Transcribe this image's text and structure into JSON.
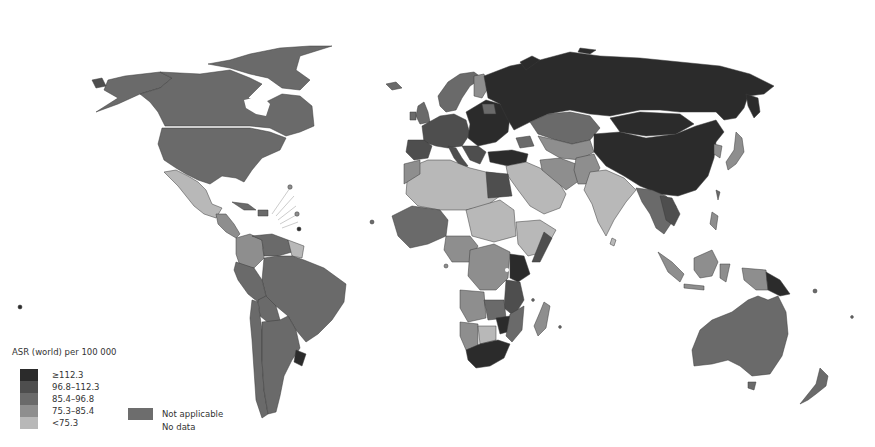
{
  "map": {
    "title": "ASR (world) per 100 000",
    "projection": "world-robinson-like",
    "palette": {
      "c5": "#2b2b2b",
      "c4": "#4e4e4e",
      "c3": "#6a6a6a",
      "c2": "#8e8e8e",
      "c1": "#b8b8b8",
      "not_applicable": "#6d6d6d",
      "no_data": "#ffffff"
    },
    "legend": {
      "title": "ASR (world) per 100 000",
      "classes": [
        {
          "label": "≥112.3",
          "color": "#2b2b2b"
        },
        {
          "label": "96.8–112.3",
          "color": "#4e4e4e"
        },
        {
          "label": "85.4–96.8",
          "color": "#6a6a6a"
        },
        {
          "label": "75.3–85.4",
          "color": "#8e8e8e"
        },
        {
          "label": "<75.3",
          "color": "#b8b8b8"
        }
      ],
      "not_applicable": {
        "label": "Not applicable",
        "color": "#6d6d6d"
      },
      "no_data": {
        "label": "No data",
        "color": "#ffffff"
      }
    },
    "regions": [
      {
        "name": "Canada",
        "class": "c3"
      },
      {
        "name": "United States",
        "class": "c3"
      },
      {
        "name": "Alaska",
        "class": "c3"
      },
      {
        "name": "Greenland",
        "class": "no_data"
      },
      {
        "name": "Mexico",
        "class": "c1"
      },
      {
        "name": "Central America",
        "class": "c2"
      },
      {
        "name": "Caribbean",
        "class": "c3"
      },
      {
        "name": "Colombia",
        "class": "c2"
      },
      {
        "name": "Venezuela",
        "class": "c3"
      },
      {
        "name": "Brazil",
        "class": "c3"
      },
      {
        "name": "Peru",
        "class": "c3"
      },
      {
        "name": "Bolivia",
        "class": "c3"
      },
      {
        "name": "Argentina",
        "class": "c3"
      },
      {
        "name": "Chile",
        "class": "c3"
      },
      {
        "name": "Uruguay",
        "class": "c5"
      },
      {
        "name": "Russia",
        "class": "c5"
      },
      {
        "name": "China",
        "class": "c5"
      },
      {
        "name": "Mongolia",
        "class": "c5"
      },
      {
        "name": "Kazakhstan",
        "class": "c3"
      },
      {
        "name": "Central Asia",
        "class": "c2"
      },
      {
        "name": "Turkey",
        "class": "c5"
      },
      {
        "name": "Western Europe",
        "class": "c4"
      },
      {
        "name": "Eastern Europe",
        "class": "c5"
      },
      {
        "name": "Scandinavia",
        "class": "c3"
      },
      {
        "name": "Finland",
        "class": "c2"
      },
      {
        "name": "UK",
        "class": "c3"
      },
      {
        "name": "Iceland",
        "class": "c3"
      },
      {
        "name": "Middle East",
        "class": "c1"
      },
      {
        "name": "Iran",
        "class": "c2"
      },
      {
        "name": "India",
        "class": "c1"
      },
      {
        "name": "Southeast Asia",
        "class": "c3"
      },
      {
        "name": "Japan",
        "class": "c2"
      },
      {
        "name": "Korea",
        "class": "c2"
      },
      {
        "name": "Indonesia",
        "class": "c2"
      },
      {
        "name": "Papua New Guinea",
        "class": "c5"
      },
      {
        "name": "Australia",
        "class": "c3"
      },
      {
        "name": "New Zealand",
        "class": "c3"
      },
      {
        "name": "North Africa",
        "class": "c1"
      },
      {
        "name": "Egypt",
        "class": "c4"
      },
      {
        "name": "West Africa",
        "class": "c3"
      },
      {
        "name": "Central Africa",
        "class": "c2"
      },
      {
        "name": "East Africa",
        "class": "c4"
      },
      {
        "name": "Kenya",
        "class": "c5"
      },
      {
        "name": "Southern Africa",
        "class": "c2"
      },
      {
        "name": "Zimbabwe",
        "class": "c5"
      },
      {
        "name": "Botswana",
        "class": "c1"
      },
      {
        "name": "South Africa",
        "class": "c5"
      },
      {
        "name": "Madagascar",
        "class": "c2"
      }
    ]
  }
}
